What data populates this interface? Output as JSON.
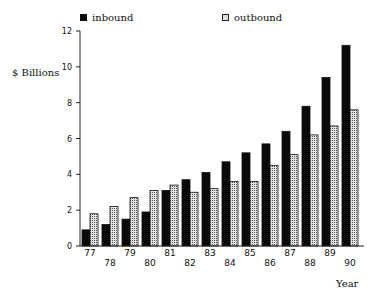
{
  "chart_data": {
    "type": "bar",
    "title": "",
    "xlabel": "Year",
    "ylabel": "$ Billions",
    "ylim": [
      0,
      12
    ],
    "yticks": [
      0,
      2,
      4,
      6,
      8,
      10,
      12
    ],
    "grid": false,
    "legend_position": "top",
    "categories": [
      "77",
      "78",
      "79",
      "80",
      "81",
      "82",
      "83",
      "84",
      "85",
      "86",
      "87",
      "88",
      "89",
      "90"
    ],
    "series": [
      {
        "name": "inbound",
        "color": "#0a0a0a",
        "pattern": "solid",
        "values": [
          0.9,
          1.2,
          1.5,
          1.9,
          3.1,
          3.7,
          4.1,
          4.7,
          5.2,
          5.7,
          6.4,
          7.8,
          9.4,
          11.2
        ]
      },
      {
        "name": "outbound",
        "color": "#d8d8d8",
        "pattern": "stippled",
        "values": [
          1.8,
          2.2,
          2.7,
          3.1,
          3.4,
          3.0,
          3.2,
          3.6,
          3.6,
          4.5,
          5.1,
          6.2,
          6.7,
          7.6
        ]
      }
    ]
  },
  "legend": {
    "inbound_label": "inbound",
    "outbound_label": "outbound"
  },
  "axes": {
    "ylabel": "$ Billions",
    "xlabel": "Year"
  }
}
